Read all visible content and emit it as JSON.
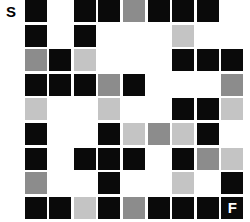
{
  "grid": {
    "columns": 10,
    "rows": 9,
    "cell_width": 22,
    "cell_height": 22,
    "pitch_x": 24.6,
    "pitch_y": 24.6,
    "origin_x": 0,
    "origin_y": 0
  },
  "palette": {
    "background": "#ffffff",
    "black": "#0a0a0a",
    "gray": "#8c8c8c",
    "light_gray": "#c4c4c4",
    "marker_fill": "#ffffff",
    "marker_text": "#000000",
    "finish_fill": "#0a0a0a",
    "finish_text": "#ffffff"
  },
  "markers": {
    "start_label": "S",
    "finish_label": "F",
    "start_cell": [
      0,
      0
    ],
    "finish_cell": [
      9,
      8
    ]
  },
  "cells": [
    [
      "start",
      "black",
      "empty",
      "black",
      "black",
      "gray",
      "black",
      "black",
      "black",
      "empty"
    ],
    [
      "empty",
      "black",
      "empty",
      "black",
      "empty",
      "empty",
      "empty",
      "lgray",
      "empty",
      "empty"
    ],
    [
      "empty",
      "gray",
      "black",
      "lgray",
      "empty",
      "empty",
      "empty",
      "black",
      "black",
      "black"
    ],
    [
      "empty",
      "black",
      "black",
      "black",
      "gray",
      "black",
      "empty",
      "empty",
      "empty",
      "gray"
    ],
    [
      "empty",
      "lgray",
      "empty",
      "empty",
      "lgray",
      "empty",
      "empty",
      "black",
      "black",
      "lgray"
    ],
    [
      "empty",
      "black",
      "empty",
      "empty",
      "black",
      "lgray",
      "gray",
      "lgray",
      "black",
      "empty"
    ],
    [
      "empty",
      "black",
      "empty",
      "black",
      "black",
      "black",
      "empty",
      "black",
      "gray",
      "lgray"
    ],
    [
      "empty",
      "gray",
      "empty",
      "empty",
      "black",
      "empty",
      "empty",
      "lgray",
      "empty",
      "black"
    ],
    [
      "empty",
      "black",
      "black",
      "lgray",
      "black",
      "gray",
      "black",
      "black",
      "black",
      "finish"
    ]
  ]
}
